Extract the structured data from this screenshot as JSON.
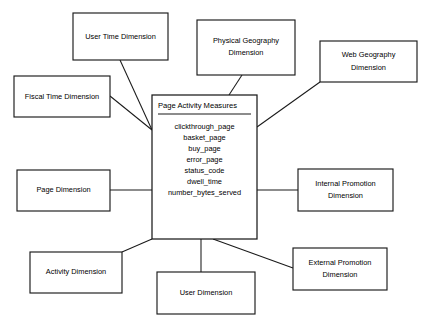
{
  "diagram": {
    "type": "star-schema",
    "background_color": "#ffffff",
    "line_color": "#1a1a1a",
    "text_color": "#000000"
  },
  "fact_table": {
    "title": "Page Activity Measures",
    "measures": [
      "clickthrough_page",
      "basket_page",
      "buy_page",
      "error_page",
      "status_code",
      "dwell_time",
      "number_bytes_served"
    ]
  },
  "dimensions": [
    {
      "id": "user-time",
      "line1": "User Time Dimension",
      "line2": ""
    },
    {
      "id": "physical-geography",
      "line1": "Physical Geography",
      "line2": "Dimension"
    },
    {
      "id": "web-geography",
      "line1": "Web Geography",
      "line2": "Dimension"
    },
    {
      "id": "fiscal-time",
      "line1": "Fiscal Time Dimension",
      "line2": ""
    },
    {
      "id": "page",
      "line1": "Page Dimension",
      "line2": ""
    },
    {
      "id": "internal-promotion",
      "line1": "Internal Promotion",
      "line2": "Dimension"
    },
    {
      "id": "activity",
      "line1": "Activity Dimension",
      "line2": ""
    },
    {
      "id": "user",
      "line1": "User Dimension",
      "line2": ""
    },
    {
      "id": "external-promotion",
      "line1": "External Promotion",
      "line2": "Dimension"
    }
  ]
}
